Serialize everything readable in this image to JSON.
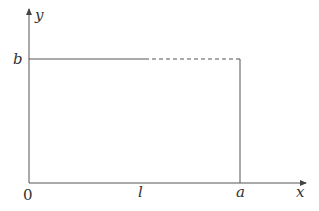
{
  "diagram": {
    "axes": {
      "x_label": "x",
      "y_label": "y",
      "origin_label": "0"
    },
    "ticks": {
      "x": [
        {
          "label": "l",
          "position": "midpoint of top edge where solid turns dashed"
        },
        {
          "label": "a",
          "position": "right edge of rectangle"
        }
      ],
      "y": [
        {
          "label": "b",
          "position": "top edge of rectangle"
        }
      ]
    },
    "rectangle": {
      "corners": [
        "(0,0)",
        "(a,0)",
        "(a,b)",
        "(0,b)"
      ],
      "top_edge": {
        "solid_from": "0",
        "solid_to": "l",
        "dashed_from": "l",
        "dashed_to": "a"
      }
    },
    "colors": {
      "line": "#555555",
      "text": "#333333",
      "background": "#ffffff"
    }
  }
}
